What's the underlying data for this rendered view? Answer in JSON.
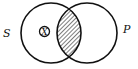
{
  "diagram": {
    "type": "venn",
    "sets": [
      {
        "name": "S",
        "label": "S"
      },
      {
        "name": "P",
        "label": "P"
      }
    ],
    "shaded_region": "S∩P",
    "marker": {
      "label": "X",
      "region": "S only"
    }
  },
  "colors": {
    "stroke": "#111111",
    "background": "#ffffff"
  }
}
